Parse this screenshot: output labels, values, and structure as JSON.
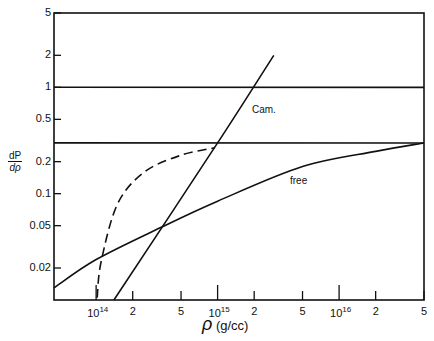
{
  "chart_data": {
    "type": "line",
    "title": "",
    "xlabel": "ρ (g/cc)",
    "ylabel": "dP/dρ",
    "xscale": "log",
    "yscale": "log",
    "xlim": [
      45000000000000.0,
      5e+16
    ],
    "ylim": [
      0.01,
      5
    ],
    "x_ticks": [
      {
        "value": 100000000000000.0,
        "label": "10",
        "sup": "14"
      },
      {
        "value": 200000000000000.0,
        "label": "2"
      },
      {
        "value": 500000000000000.0,
        "label": "5"
      },
      {
        "value": 1000000000000000.0,
        "label": "10",
        "sup": "15"
      },
      {
        "value": 2000000000000000.0,
        "label": "2"
      },
      {
        "value": 5000000000000000.0,
        "label": "5"
      },
      {
        "value": 1e+16,
        "label": "10",
        "sup": "16"
      },
      {
        "value": 2e+16,
        "label": "2"
      },
      {
        "value": 5e+16,
        "label": "5"
      }
    ],
    "y_ticks": [
      {
        "value": 5,
        "label": "5"
      },
      {
        "value": 2,
        "label": "2"
      },
      {
        "value": 1,
        "label": "1"
      },
      {
        "value": 0.5,
        "label": "0.5"
      },
      {
        "value": 0.2,
        "label": "0.2"
      },
      {
        "value": 0.1,
        "label": "0.1"
      },
      {
        "value": 0.05,
        "label": "0.05"
      },
      {
        "value": 0.02,
        "label": "0.02"
      }
    ],
    "grid": false,
    "series": [
      {
        "name": "Cam.",
        "style": "solid",
        "x": [
          140000000000000.0,
          1000000000000000.0,
          2900000000000000.0
        ],
        "y": [
          0.01,
          0.3,
          2
        ]
      },
      {
        "name": "free",
        "style": "solid",
        "x": [
          45000000000000.0,
          100000000000000.0,
          340000000000000.0,
          1000000000000000.0,
          5000000000000000.0,
          2e+16,
          5e+16
        ],
        "y": [
          0.013,
          0.024,
          0.048,
          0.085,
          0.18,
          0.25,
          0.3
        ]
      },
      {
        "name": "dashed",
        "style": "dashed",
        "x": [
          102000000000000.0,
          110000000000000.0,
          150000000000000.0,
          250000000000000.0,
          500000000000000.0,
          950000000000000.0
        ],
        "y": [
          0.0105,
          0.023,
          0.08,
          0.16,
          0.23,
          0.27
        ]
      },
      {
        "name": "horizontal-1",
        "style": "solid",
        "x": [
          45000000000000.0,
          5e+16
        ],
        "y": [
          1,
          1
        ]
      },
      {
        "name": "horizontal-0.3",
        "style": "solid",
        "x": [
          45000000000000.0,
          5e+16
        ],
        "y": [
          0.3,
          0.3
        ]
      }
    ],
    "annotations": [
      {
        "text": "Cam.",
        "x": 2000000000000000.0,
        "y": 0.65
      },
      {
        "text": "free",
        "x": 6000000000000000.0,
        "y": 0.12
      }
    ]
  },
  "labels": {
    "y_num": "dP",
    "y_den": "dρ",
    "x_symbol": "ρ",
    "x_unit": "(g/cc)",
    "cam": "Cam.",
    "free": "free"
  }
}
